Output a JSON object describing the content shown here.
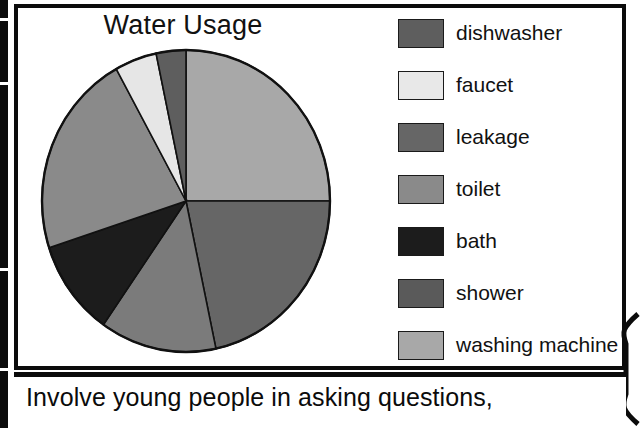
{
  "chart_data": {
    "type": "pie",
    "title": "Water Usage",
    "categories": [
      "dishwasher",
      "faucet",
      "leakage",
      "toilet",
      "bath",
      "shower",
      "washing machine"
    ],
    "values": [
      3,
      5,
      22,
      22,
      10,
      13,
      25
    ],
    "units": "percent",
    "legend_position": "right",
    "start_angle_deg": 0,
    "direction": "clockwise",
    "slices": [
      {
        "label": "washing machine",
        "value": 25,
        "color": "#a8a8a8",
        "start_deg": 0,
        "end_deg": 90
      },
      {
        "label": "leakage",
        "value": 22,
        "color": "#666666",
        "start_deg": 90,
        "end_deg": 168
      },
      {
        "label": "shower",
        "value": 13,
        "color": "#7b7b7b",
        "start_deg": 168,
        "end_deg": 215
      },
      {
        "label": "bath",
        "value": 10,
        "color": "#1c1c1c",
        "start_deg": 215,
        "end_deg": 252
      },
      {
        "label": "toilet",
        "value": 22,
        "color": "#8a8a8a",
        "start_deg": 252,
        "end_deg": 331
      },
      {
        "label": "faucet",
        "value": 5,
        "color": "#e6e6e6",
        "start_deg": 331,
        "end_deg": 348
      },
      {
        "label": "dishwasher",
        "value": 3,
        "color": "#5e5e5e",
        "start_deg": 348,
        "end_deg": 360
      }
    ],
    "colors": {
      "dishwasher": "#5e5e5e",
      "faucet": "#e6e6e6",
      "leakage": "#666666",
      "toilet": "#8a8a8a",
      "bath": "#1c1c1c",
      "shower": "#5a5a5a",
      "washing machine": "#a8a8a8"
    }
  },
  "chart": {
    "title": "Water Usage"
  },
  "legend": {
    "items": [
      {
        "label": "dishwasher",
        "color": "#5e5e5e"
      },
      {
        "label": "faucet",
        "color": "#e8e8e8"
      },
      {
        "label": "leakage",
        "color": "#666666"
      },
      {
        "label": "toilet",
        "color": "#8a8a8a"
      },
      {
        "label": "bath",
        "color": "#1c1c1c"
      },
      {
        "label": "shower",
        "color": "#5a5a5a"
      },
      {
        "label": "washing machine",
        "color": "#a8a8a8"
      }
    ]
  },
  "caption": {
    "text": "Involve young people in asking questions,"
  },
  "colors": {
    "frame": "#0b0b0b",
    "background": "#ffffff",
    "text": "#111111"
  }
}
